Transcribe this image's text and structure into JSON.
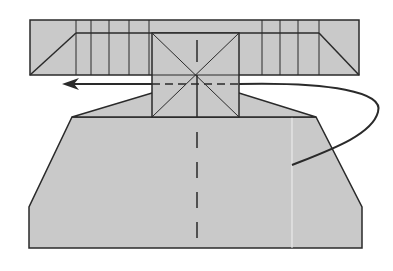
{
  "diagram": {
    "colors": {
      "paper": "#c9c9c9",
      "stroke": "#2a2a2a",
      "background": "#ffffff",
      "crease_highlight": "#f0f0f0"
    },
    "elements": {
      "top_band": "folded-pleat-band",
      "center_square": "center-square-with-diagonals",
      "bottom_body": "trapezoid-body",
      "fold_arrow": "arrow-left",
      "turn_arrow": "curved-arrow-behind",
      "center_crease": "valley-fold-dashed-line"
    }
  }
}
